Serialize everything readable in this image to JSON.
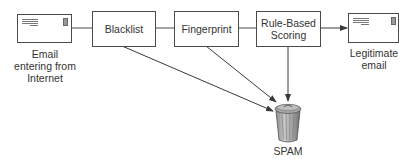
{
  "diagram": {
    "nodes": {
      "source": {
        "label": "Email entering from Internet",
        "lines": [
          "Email",
          "entering from",
          "Internet"
        ],
        "icon": "envelope-icon"
      },
      "blacklist": {
        "label": "Blacklist"
      },
      "fingerprint": {
        "label": "Fingerprint"
      },
      "rule_based": {
        "label": "Rule-Based Scoring",
        "lines": [
          "Rule-Based",
          "Scoring"
        ]
      },
      "legitimate": {
        "label": "Legitimate email",
        "lines": [
          "Legitimate",
          "email"
        ],
        "icon": "envelope-icon"
      },
      "spam": {
        "label": "SPAM",
        "icon": "trash-can-icon"
      }
    },
    "edges": [
      {
        "from": "source",
        "to": "blacklist",
        "type": "line"
      },
      {
        "from": "blacklist",
        "to": "fingerprint",
        "type": "line"
      },
      {
        "from": "fingerprint",
        "to": "rule_based",
        "type": "line"
      },
      {
        "from": "rule_based",
        "to": "legitimate",
        "type": "arrow"
      },
      {
        "from": "blacklist",
        "to": "spam",
        "type": "arrow"
      },
      {
        "from": "fingerprint",
        "to": "spam",
        "type": "arrow"
      },
      {
        "from": "rule_based",
        "to": "spam",
        "type": "arrow"
      }
    ],
    "colors": {
      "stroke": "#4a4a4a",
      "text": "#333333",
      "can_body": "#9a9a9a"
    }
  }
}
